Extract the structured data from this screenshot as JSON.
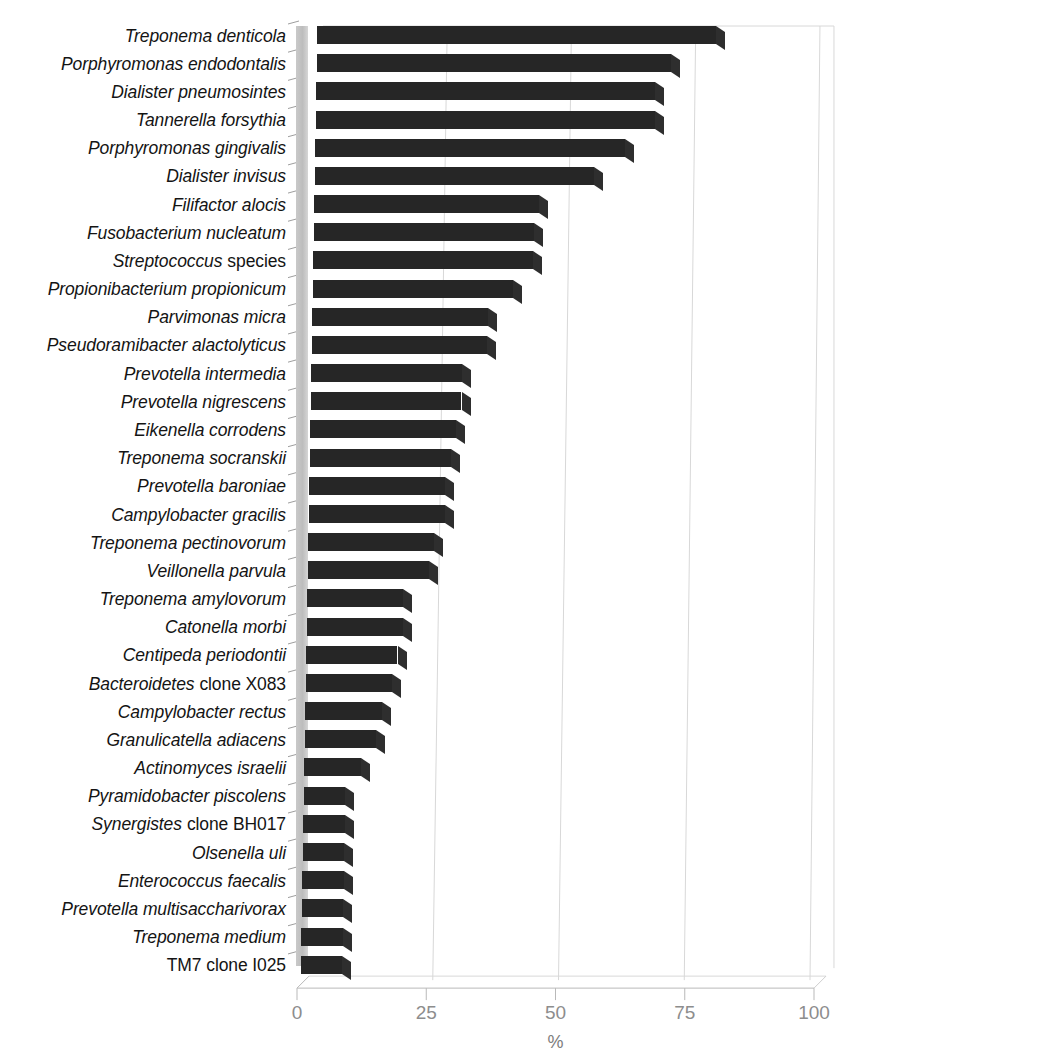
{
  "chart_data": {
    "type": "bar",
    "orientation": "horizontal",
    "title": "",
    "xlabel": "%",
    "ylabel": "",
    "xlim": [
      0,
      100
    ],
    "xticks": [
      0,
      25,
      50,
      75,
      100
    ],
    "grid": true,
    "legend": null,
    "style": "3d-horizontal-bar",
    "bar_color": "#262626",
    "grid_color": "#d8d8d8",
    "tick_label_color": "#8d8d8d",
    "categories": [
      "Treponema denticola",
      "Porphyromonas endodontalis",
      "Dialister pneumosintes",
      "Tannerella forsythia",
      "Porphyromonas gingivalis",
      "Dialister invisus",
      "Filifactor alocis",
      "Fusobacterium nucleatum",
      "Streptococcus species",
      "Propionibacterium propionicum",
      "Parvimonas micra",
      "Pseudoramibacter alactolyticus",
      "Prevotella intermedia",
      "Prevotella nigrescens",
      "Eikenella corrodens",
      "Treponema socranskii",
      "Prevotella baroniae",
      "Campylobacter gracilis",
      "Treponema pectinovorum",
      "Veillonella parvula",
      "Treponema amylovorum",
      "Catonella morbi",
      "Centipeda periodontii",
      "Bacteroidetes clone X083",
      "Campylobacter rectus",
      "Granulicatella adiacens",
      "Actinomyces israelii",
      "Pyramidobacter piscolens",
      "Synergistes clone BH017",
      "Olsenella uli",
      "Enterococcus faecalis",
      "Prevotella multisaccharivorax",
      "Treponema medium",
      "TM7 clone I025"
    ],
    "values": [
      79,
      70,
      67,
      67,
      61,
      55,
      44,
      43,
      43,
      39,
      34,
      34,
      29,
      29,
      28,
      27,
      26,
      26,
      24,
      23,
      18,
      18,
      17,
      16,
      14,
      13,
      10,
      7,
      7,
      7,
      7,
      7,
      7,
      7
    ],
    "labels": [
      {
        "italic": "Treponema denticola",
        "upright": ""
      },
      {
        "italic": "Porphyromonas endodontalis",
        "upright": ""
      },
      {
        "italic": "Dialister pneumosintes",
        "upright": ""
      },
      {
        "italic": "Tannerella forsythia",
        "upright": ""
      },
      {
        "italic": "Porphyromonas gingivalis",
        "upright": ""
      },
      {
        "italic": "Dialister invisus",
        "upright": ""
      },
      {
        "italic": "Filifactor alocis",
        "upright": ""
      },
      {
        "italic": "Fusobacterium nucleatum",
        "upright": ""
      },
      {
        "italic": "Streptococcus",
        "upright": "species"
      },
      {
        "italic": "Propionibacterium propionicum",
        "upright": ""
      },
      {
        "italic": "Parvimonas micra",
        "upright": ""
      },
      {
        "italic": "Pseudoramibacter alactolyticus",
        "upright": ""
      },
      {
        "italic": "Prevotella intermedia",
        "upright": ""
      },
      {
        "italic": "Prevotella nigrescens",
        "upright": ""
      },
      {
        "italic": "Eikenella corrodens",
        "upright": ""
      },
      {
        "italic": "Treponema socranskii",
        "upright": ""
      },
      {
        "italic": "Prevotella baroniae",
        "upright": ""
      },
      {
        "italic": "Campylobacter gracilis",
        "upright": ""
      },
      {
        "italic": "Treponema pectinovorum",
        "upright": ""
      },
      {
        "italic": "Veillonella parvula",
        "upright": ""
      },
      {
        "italic": "Treponema amylovorum",
        "upright": ""
      },
      {
        "italic": "Catonella morbi",
        "upright": ""
      },
      {
        "italic": "Centipeda periodontii",
        "upright": ""
      },
      {
        "italic": "Bacteroidetes",
        "upright": "clone X083"
      },
      {
        "italic": "Campylobacter rectus",
        "upright": ""
      },
      {
        "italic": "Granulicatella adiacens",
        "upright": ""
      },
      {
        "italic": "Actinomyces israelii",
        "upright": ""
      },
      {
        "italic": "Pyramidobacter piscolens",
        "upright": ""
      },
      {
        "italic": "Synergistes",
        "upright": "clone BH017"
      },
      {
        "italic": "Olsenella uli",
        "upright": ""
      },
      {
        "italic": "Enterococcus faecalis",
        "upright": ""
      },
      {
        "italic": "Prevotella multisaccharivorax",
        "upright": ""
      },
      {
        "italic": "Treponema medium",
        "upright": ""
      },
      {
        "italic": "",
        "upright": "TM7 clone I025"
      }
    ]
  }
}
